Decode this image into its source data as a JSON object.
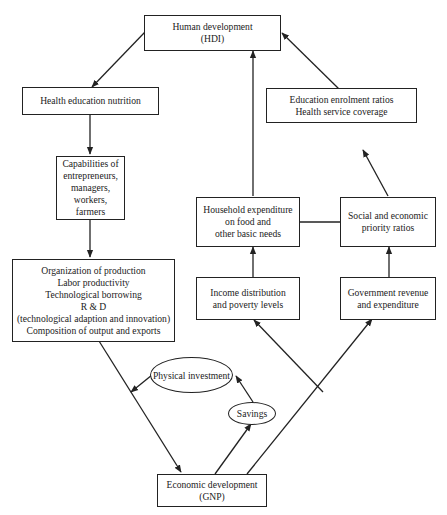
{
  "diagram": {
    "nodes": {
      "hdi": {
        "lines": [
          "Human development",
          "(HDI)"
        ]
      },
      "health": {
        "lines": [
          "Health education nutrition"
        ]
      },
      "capabilities": {
        "lines": [
          "Capabilities of",
          "entrepreneurs,",
          "managers,",
          "workers,",
          "farmers"
        ]
      },
      "organization": {
        "lines": [
          "Organization of production",
          "Labor productivity",
          "Technological borrowing",
          "R & D",
          "(technological adaption and innovation)",
          "Composition of output and exports"
        ]
      },
      "education_ratios": {
        "lines": [
          "Education enrolment ratios",
          "Health service coverage"
        ]
      },
      "household": {
        "lines": [
          "Household expenditure",
          "on food and",
          "other basic needs"
        ]
      },
      "social": {
        "lines": [
          "Social and economic",
          "priority ratios"
        ]
      },
      "income": {
        "lines": [
          "Income distribution",
          "and poverty levels"
        ]
      },
      "government": {
        "lines": [
          "Government revenue",
          "and expenditure"
        ]
      },
      "physical_investment": {
        "lines": [
          "Physical investment"
        ]
      },
      "savings": {
        "lines": [
          "Savings"
        ]
      },
      "gnp": {
        "lines": [
          "Economic development",
          "(GNP)"
        ]
      }
    },
    "edges": [
      {
        "from": "hdi",
        "to": "health"
      },
      {
        "from": "health",
        "to": "capabilities"
      },
      {
        "from": "capabilities",
        "to": "organization"
      },
      {
        "from": "organization",
        "to": "gnp"
      },
      {
        "from": "physical_investment",
        "to": "organization-gnp link"
      },
      {
        "from": "savings",
        "to": "physical_investment"
      },
      {
        "from": "gnp",
        "to": "savings"
      },
      {
        "from": "gnp",
        "to": "income"
      },
      {
        "from": "gnp",
        "to": "government"
      },
      {
        "from": "income",
        "to": "household"
      },
      {
        "from": "household",
        "to": "hdi"
      },
      {
        "from": "government",
        "to": "social"
      },
      {
        "from": "social",
        "to": "education_ratios"
      },
      {
        "from": "education_ratios",
        "to": "hdi"
      },
      {
        "from": "household",
        "to": "social",
        "undirected": true
      }
    ]
  }
}
